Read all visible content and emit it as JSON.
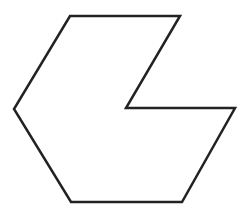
{
  "diagram": {
    "type": "polygon",
    "stroke_color": "#222222",
    "fill_color": "#ffffff",
    "stroke_width": 2.5,
    "vertices": [
      [
        70,
        16
      ],
      [
        180,
        16
      ],
      [
        126,
        108
      ],
      [
        235,
        108
      ],
      [
        182,
        202
      ],
      [
        71,
        202
      ],
      [
        14,
        109
      ]
    ]
  }
}
